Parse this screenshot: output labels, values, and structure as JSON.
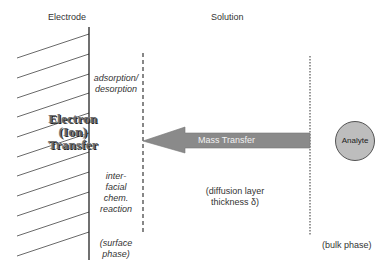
{
  "headers": {
    "electrode": "Electrode",
    "solution": "Solution"
  },
  "electrode_process": {
    "line1": "Electron",
    "line2": "(Ion)",
    "line3": "Transfer"
  },
  "surface_labels": {
    "adsorption_1": "adsorption/",
    "adsorption_2": "desorption",
    "reaction_1": "inter-",
    "reaction_2": "facial",
    "reaction_3": "chem.",
    "reaction_4": "reaction",
    "surface_1": "(surface",
    "surface_2": "phase)"
  },
  "mass_transfer": {
    "label": "Mass Transfer",
    "arrow_color": "#8a8a8a"
  },
  "analyte": {
    "label": "Analyte",
    "fill_color": "#bdbdbd"
  },
  "diffusion_layer": {
    "line1": "(diffusion layer",
    "line2": "thickness δ)"
  },
  "bulk": {
    "label": "(bulk phase)"
  }
}
